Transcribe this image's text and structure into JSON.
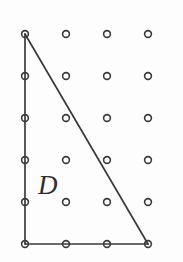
{
  "figure": {
    "background_color": "#fdfdfd",
    "width": 183,
    "height": 262,
    "ink_color": "#3a3a3a"
  },
  "lattice": {
    "columns": 4,
    "rows": 6,
    "x_positions": [
      25,
      66,
      107,
      148
    ],
    "y_positions": [
      34,
      76,
      118,
      160,
      202,
      244
    ],
    "spacing_x": 41,
    "spacing_y": 42,
    "dot_radius": 3.4,
    "dot_style": "open-circle",
    "points": [
      {
        "x": 25,
        "y": 34
      },
      {
        "x": 66,
        "y": 34
      },
      {
        "x": 107,
        "y": 34
      },
      {
        "x": 148,
        "y": 34
      },
      {
        "x": 25,
        "y": 76
      },
      {
        "x": 66,
        "y": 76
      },
      {
        "x": 107,
        "y": 76
      },
      {
        "x": 148,
        "y": 76
      },
      {
        "x": 25,
        "y": 118
      },
      {
        "x": 66,
        "y": 118
      },
      {
        "x": 107,
        "y": 118
      },
      {
        "x": 148,
        "y": 118
      },
      {
        "x": 25,
        "y": 160
      },
      {
        "x": 66,
        "y": 160
      },
      {
        "x": 107,
        "y": 160
      },
      {
        "x": 148,
        "y": 160
      },
      {
        "x": 25,
        "y": 202
      },
      {
        "x": 66,
        "y": 202
      },
      {
        "x": 107,
        "y": 202
      },
      {
        "x": 148,
        "y": 202
      },
      {
        "x": 25,
        "y": 244
      },
      {
        "x": 66,
        "y": 244
      },
      {
        "x": 107,
        "y": 244
      },
      {
        "x": 148,
        "y": 244
      }
    ]
  },
  "region": {
    "name": "D",
    "label": "D",
    "shape": "right-triangle",
    "label_position": {
      "x": 38,
      "y": 172
    },
    "vertices": [
      {
        "name": "apex-top-left",
        "x": 25,
        "y": 34
      },
      {
        "name": "corner-bottom-left",
        "x": 25,
        "y": 244
      },
      {
        "name": "corner-bottom-right",
        "x": 148,
        "y": 244
      }
    ],
    "edges": [
      {
        "name": "left-edge-vertical",
        "x1": 25,
        "y1": 34,
        "x2": 25,
        "y2": 244
      },
      {
        "name": "bottom-edge-horizontal",
        "x1": 25,
        "y1": 244,
        "x2": 148,
        "y2": 244
      },
      {
        "name": "hypotenuse",
        "x1": 25,
        "y1": 34,
        "x2": 148,
        "y2": 244
      }
    ]
  }
}
